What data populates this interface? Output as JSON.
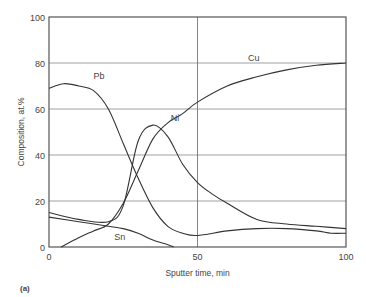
{
  "figure_label": "(a)",
  "chart_data": {
    "type": "line",
    "title": "",
    "xlabel": "Sputter time, min",
    "ylabel": "Composition, at.%",
    "xlim": [
      0,
      100
    ],
    "ylim": [
      0,
      100
    ],
    "xticks": [
      0,
      50,
      100
    ],
    "yticks": [
      0,
      20,
      40,
      60,
      80,
      100
    ],
    "grid": {
      "horizontal": [
        20,
        40,
        60,
        80
      ],
      "vertical": [
        50
      ]
    },
    "legend": "inline labels",
    "series": [
      {
        "name": "Pb",
        "label_pos": [
          15,
          73
        ],
        "x": [
          0,
          5,
          10,
          15,
          20,
          25,
          30,
          35,
          40,
          45,
          50,
          60,
          70,
          80,
          90,
          95,
          100
        ],
        "y": [
          69,
          71,
          70,
          68,
          60,
          45,
          30,
          17,
          9,
          6,
          5,
          7,
          8,
          8,
          7,
          6,
          6
        ]
      },
      {
        "name": "Ni",
        "label_pos": [
          41,
          55
        ],
        "x": [
          0,
          10,
          20,
          25,
          30,
          35,
          40,
          45,
          50,
          55,
          60,
          70,
          80,
          90,
          100
        ],
        "y": [
          15,
          12,
          11,
          18,
          46,
          53,
          48,
          36,
          28,
          23,
          19,
          12,
          10,
          9,
          8
        ]
      },
      {
        "name": "Cu",
        "label_pos": [
          67,
          81
        ],
        "x": [
          4,
          10,
          15,
          20,
          25,
          30,
          35,
          40,
          45,
          50,
          60,
          70,
          80,
          90,
          100
        ],
        "y": [
          0,
          4,
          7,
          10,
          19,
          33,
          47,
          54,
          58,
          63,
          70,
          74,
          77,
          79,
          80
        ]
      },
      {
        "name": "Sn",
        "label_pos": [
          22,
          3
        ],
        "x": [
          0,
          10,
          20,
          25,
          30,
          35,
          40,
          42
        ],
        "y": [
          13,
          11,
          9,
          8,
          6,
          3,
          1,
          0
        ]
      }
    ]
  }
}
